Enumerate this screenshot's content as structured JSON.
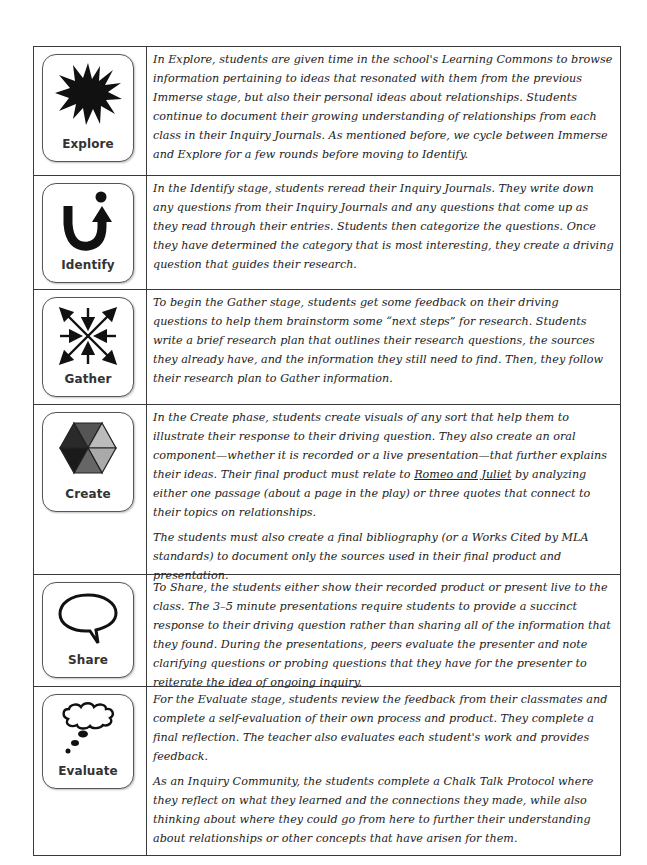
{
  "stages": [
    {
      "label": "Explore",
      "icon": "starburst-icon",
      "paragraphs": [
        "In Explore, students are given time in the school's Learning Commons to browse information pertaining to ideas that resonated with them from the previous Immerse stage, but also their personal ideas about relationships. Students continue to document their growing understanding of relationships from each class in their Inquiry Journals. As mentioned before, we cycle between Immerse and Explore for a few rounds before moving to Identify."
      ]
    },
    {
      "label": "Identify",
      "icon": "u-turn-arrow-icon",
      "paragraphs": [
        "In the Identify stage, students reread their Inquiry Journals. They write down any questions from their Inquiry Journals and any questions that come up as they read through their entries. Students then categorize the questions. Once they have determined the category that is most interesting, they create a driving question that guides their research."
      ]
    },
    {
      "label": "Gather",
      "icon": "converging-arrows-icon",
      "paragraphs": [
        "To begin the Gather stage, students get some feedback on their driving questions to help them brainstorm some “next steps” for research. Students write a brief research plan that outlines their research questions, the sources they already have, and the information they still need to find. Then, they follow their research plan to Gather information."
      ]
    },
    {
      "label": "Create",
      "icon": "hexagon-icon",
      "paragraphs": [
        {
          "before": "In the Create phase, students create visuals of any sort that help them to illustrate their response to their driving question. They also create an oral component—whether it is recorded or a live presentation—that further explains their ideas. Their final product must relate to ",
          "underlined": "Romeo and Juliet",
          "after": " by analyzing either one passage (about a page in the play) or three quotes that connect to their topics on relationships."
        },
        "The students must also create a final bibliography (or a Works Cited by MLA standards) to document only the sources used in their final product and presentation."
      ]
    },
    {
      "label": "Share",
      "icon": "speech-bubble-icon",
      "paragraphs": [
        "To Share, the students either show their recorded product or present live to the class. The 3–5 minute presentations require students to provide a succinct response to their driving question rather than sharing all of the information that they found. During the presentations, peers evaluate the presenter and note clarifying questions or probing questions that they have for the presenter to reiterate the idea of ongoing inquiry."
      ]
    },
    {
      "label": "Evaluate",
      "icon": "thought-bubble-icon",
      "paragraphs": [
        "For the Evaluate stage, students review the feedback from their classmates and complete a self-evaluation of their own process and product. They complete a final reflection. The teacher also evaluates each student's work and provides feedback.",
        "As an Inquiry Community, the students complete a Chalk Talk Protocol where they reflect on what they learned and the connections they made, while also thinking about where they could go from here to further their understanding about relationships or other concepts that have arisen for them."
      ]
    }
  ]
}
